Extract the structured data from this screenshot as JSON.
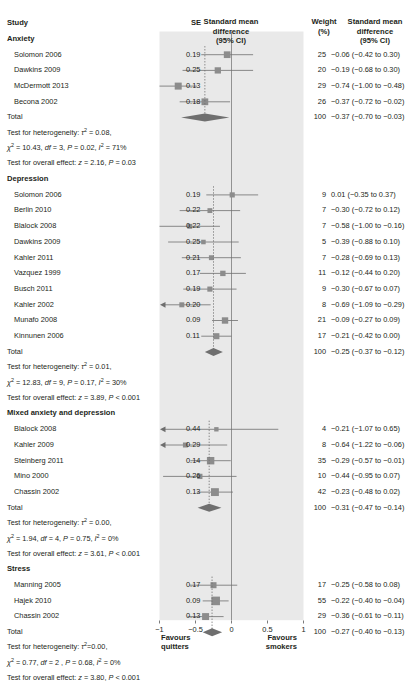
{
  "header": {
    "study": "Study",
    "se": "SE",
    "smd_plot": [
      "Standard mean",
      "difference",
      "(95% CI)"
    ],
    "weight": [
      "Weight",
      "(%)"
    ],
    "smd_col": [
      "Standard mean",
      "difference",
      "(95% CI)"
    ]
  },
  "axis": {
    "ticks": [
      -1,
      -0.5,
      0,
      0.5,
      1
    ],
    "tick_labels": [
      "−1",
      "−0.5",
      "0",
      "0.5",
      "1"
    ],
    "xlim": [
      -1,
      1
    ],
    "null_line": 0,
    "footnote_left": [
      "Favours",
      "quitters"
    ],
    "footnote_right": [
      "Favours",
      "smokers"
    ]
  },
  "colors": {
    "panel": "#e9e9e9",
    "marker": "#8c8c8c",
    "line": "#6e6e6e",
    "diamond": "#6f6f6f",
    "text": "#231f20",
    "axis": "#888888"
  },
  "chart_data": {
    "type": "forest",
    "xlabel": "Standard mean difference (95% CI)",
    "ylabel": "",
    "xlim": [
      -1,
      1
    ],
    "grid": false,
    "null_line": 0,
    "groups": [
      {
        "label": "Anxiety",
        "studies": [
          {
            "name": "Solomon 2006",
            "se": "0.19",
            "weight": "25",
            "estimate": -0.06,
            "ci_low": -0.42,
            "ci_high": 0.3,
            "ci_text": "−0.06 (−0.42 to 0.30)"
          },
          {
            "name": "Dawkins 2009",
            "se": "0.25",
            "weight": "20",
            "estimate": -0.19,
            "ci_low": -0.68,
            "ci_high": 0.3,
            "ci_text": "−0.19 (−0.68 to 0.30)"
          },
          {
            "name": "McDermott 2013",
            "se": "0.13",
            "weight": "29",
            "estimate": -0.74,
            "ci_low": -1.0,
            "ci_high": -0.48,
            "ci_text": "−0.74 (−1.00 to −0.48)"
          },
          {
            "name": "Becona 2002",
            "se": "0.18",
            "weight": "26",
            "estimate": -0.37,
            "ci_low": -0.72,
            "ci_high": -0.02,
            "ci_text": "−0.37 (−0.72 to −0.02)"
          }
        ],
        "total": {
          "name": "Total",
          "weight": "100",
          "estimate": -0.37,
          "ci_low": -0.7,
          "ci_high": -0.03,
          "ci_text": "−0.37 (−0.70 to −0.03)"
        },
        "heterogeneity_lines": [
          "Test for heterogeneity: τ² = 0.08,",
          "χ² = 10.43, df = 3, P = 0.02, I² = 71%",
          "Test for overall effect: z = 2.16, P = 0.03"
        ]
      },
      {
        "label": "Depression",
        "studies": [
          {
            "name": "Solomon 2006",
            "se": "0.19",
            "weight": "9",
            "estimate": 0.01,
            "ci_low": -0.35,
            "ci_high": 0.37,
            "ci_text": "0.01 (−0.35 to 0.37)"
          },
          {
            "name": "Berlin 2010",
            "se": "0.22",
            "weight": "7",
            "estimate": -0.3,
            "ci_low": -0.72,
            "ci_high": 0.12,
            "ci_text": "−0.30 (−0.72 to 0.12)"
          },
          {
            "name": "Blalock 2008",
            "se": "0.22",
            "weight": "7",
            "estimate": -0.58,
            "ci_low": -1.0,
            "ci_high": -0.16,
            "ci_text": "−0.58 (−1.00 to −0.16)"
          },
          {
            "name": "Dawkins 2009",
            "se": "0.25",
            "weight": "5",
            "estimate": -0.39,
            "ci_low": -0.88,
            "ci_high": 0.1,
            "ci_text": "−0.39 (−0.88 to 0.10)"
          },
          {
            "name": "Kahler 2011",
            "se": "0.21",
            "weight": "7",
            "estimate": -0.28,
            "ci_low": -0.69,
            "ci_high": 0.13,
            "ci_text": "−0.28 (−0.69 to 0.13)"
          },
          {
            "name": "Vazquez 1999",
            "se": "0.17",
            "weight": "11",
            "estimate": -0.12,
            "ci_low": -0.44,
            "ci_high": 0.2,
            "ci_text": "−0.12 (−0.44 to 0.20)"
          },
          {
            "name": "Busch 2011",
            "se": "0.19",
            "weight": "9",
            "estimate": -0.3,
            "ci_low": -0.67,
            "ci_high": 0.07,
            "ci_text": "−0.30 (−0.67 to 0.07)"
          },
          {
            "name": "Kahler 2002",
            "se": "0.20",
            "weight": "8",
            "estimate": -0.69,
            "ci_low": -1.09,
            "ci_high": -0.29,
            "ci_text": "−0.69 (−1.09 to −0.29)"
          },
          {
            "name": "Munafo 2008",
            "se": "0.09",
            "weight": "21",
            "estimate": -0.09,
            "ci_low": -0.27,
            "ci_high": 0.09,
            "ci_text": "−0.09 (−0.27 to 0.09)"
          },
          {
            "name": "Kinnunen 2006",
            "se": "0.11",
            "weight": "17",
            "estimate": -0.21,
            "ci_low": -0.42,
            "ci_high": 0.0,
            "ci_text": "−0.21 (−0.42 to 0.00)"
          }
        ],
        "total": {
          "name": "Total",
          "weight": "100",
          "estimate": -0.25,
          "ci_low": -0.37,
          "ci_high": -0.12,
          "ci_text": "−0.25 (−0.37 to −0.12)"
        },
        "heterogeneity_lines": [
          "Test for heterogeneity: τ² = 0.01,",
          "χ² = 12.83, df = 9, P = 0.17, I² = 30%",
          "Test for overall effect: z = 3.89, P < 0.001"
        ]
      },
      {
        "label": "Mixed anxiety and depression",
        "studies": [
          {
            "name": "Blalock 2008",
            "se": "0.44",
            "weight": "4",
            "estimate": -0.21,
            "ci_low": -1.07,
            "ci_high": 0.65,
            "ci_text": "−0.21 (−1.07 to 0.65)"
          },
          {
            "name": "Kahler 2009",
            "se": "0.29",
            "weight": "8",
            "estimate": -0.64,
            "ci_low": -1.22,
            "ci_high": -0.06,
            "ci_text": "−0.64 (−1.22 to −0.06)"
          },
          {
            "name": "Steinberg 2011",
            "se": "0.14",
            "weight": "35",
            "estimate": -0.29,
            "ci_low": -0.57,
            "ci_high": -0.01,
            "ci_text": "−0.29 (−0.57 to −0.01)"
          },
          {
            "name": "Mino 2000",
            "se": "0.26",
            "weight": "10",
            "estimate": -0.44,
            "ci_low": -0.95,
            "ci_high": 0.07,
            "ci_text": "−0.44 (−0.95 to 0.07)"
          },
          {
            "name": "Chassin 2002",
            "se": "0.13",
            "weight": "42",
            "estimate": -0.23,
            "ci_low": -0.48,
            "ci_high": 0.02,
            "ci_text": "−0.23 (−0.48 to 0.02)"
          }
        ],
        "total": {
          "name": "Total",
          "weight": "100",
          "estimate": -0.31,
          "ci_low": -0.47,
          "ci_high": -0.14,
          "ci_text": "−0.31 (−0.47 to −0.14)"
        },
        "heterogeneity_lines": [
          "Test for heterogeneity: τ² = 0.00,",
          "χ² = 1.94, df = 4, P = 0.75, I² = 0%",
          "Test for overall effect: z = 3.61, P < 0.001"
        ]
      },
      {
        "label": "Stress",
        "studies": [
          {
            "name": "Manning 2005",
            "se": "0.17",
            "weight": "17",
            "estimate": -0.25,
            "ci_low": -0.58,
            "ci_high": 0.08,
            "ci_text": "−0.25 (−0.58 to 0.08)"
          },
          {
            "name": "Hajek 2010",
            "se": "0.09",
            "weight": "55",
            "estimate": -0.22,
            "ci_low": -0.4,
            "ci_high": -0.04,
            "ci_text": "−0.22 (−0.40 to −0.04)"
          },
          {
            "name": "Chassin 2002",
            "se": "0.13",
            "weight": "29",
            "estimate": -0.36,
            "ci_low": -0.61,
            "ci_high": -0.11,
            "ci_text": "−0.36 (−0.61 to −0.11)"
          }
        ],
        "total": {
          "name": "Total",
          "weight": "100",
          "estimate": -0.27,
          "ci_low": -0.4,
          "ci_high": -0.13,
          "ci_text": "−0.27 (−0.40 to −0.13)"
        },
        "heterogeneity_lines": [
          "Test for heterogeneity: τ²=0.00,",
          "χ² = 0.77, df = 2 , P = 0.68, I² = 0%",
          "Test for overall effect: z = 3.80, P < 0.001"
        ]
      }
    ]
  }
}
